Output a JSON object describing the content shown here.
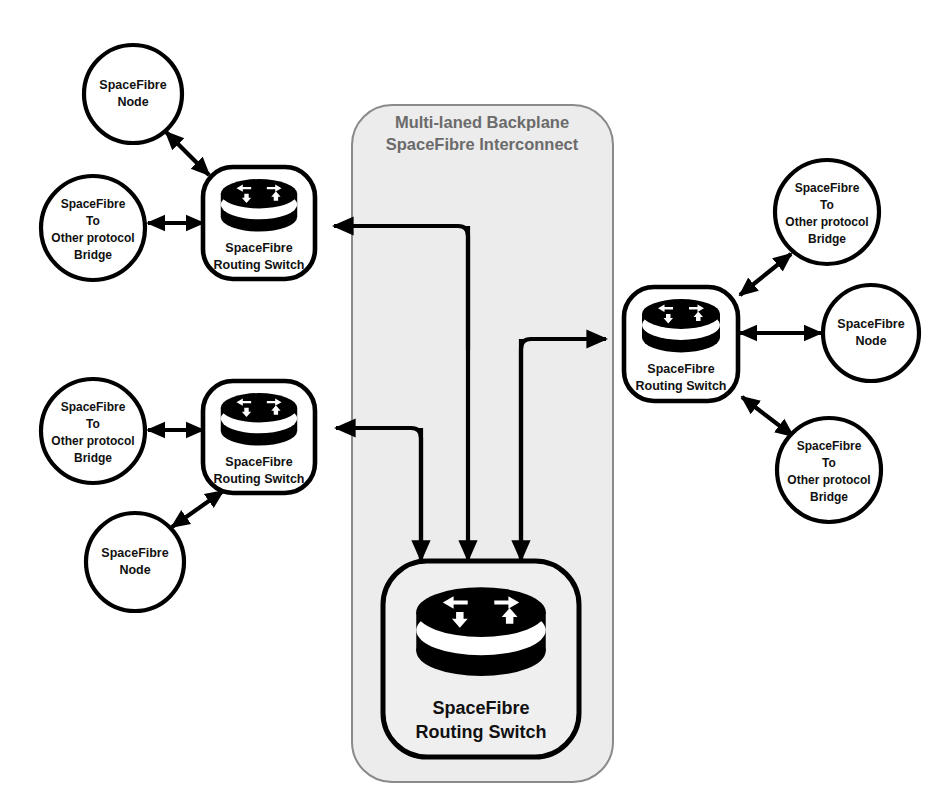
{
  "diagram": {
    "title_line1": "Multi-laned Backplane",
    "title_line2": "SpaceFibre Interconnect",
    "backplane_fill": "#ececec",
    "backplane_stroke": "#8a8a8a",
    "title_color": "#6b6b6b",
    "line_color": "#000000",
    "node_stroke": "#000000",
    "label_color": "#111111"
  },
  "labels": {
    "node_l1": "SpaceFibre",
    "node_l2": "Node",
    "bridge_l1": "SpaceFibre",
    "bridge_l2": "To",
    "bridge_l3": "Other protocol",
    "bridge_l4": "Bridge",
    "switch_l1": "SpaceFibre",
    "switch_l2": "Routing Switch"
  },
  "nodes": [
    {
      "id": "node-top-left",
      "kind": "node",
      "cx": 133,
      "cy": 94,
      "r": 49
    },
    {
      "id": "bridge-top-left",
      "kind": "bridge",
      "cx": 93,
      "cy": 228,
      "r": 52
    },
    {
      "id": "switch-top-left",
      "kind": "switch",
      "cx": 259,
      "cy": 223
    },
    {
      "id": "bridge-mid-left",
      "kind": "bridge",
      "cx": 93,
      "cy": 431,
      "r": 52
    },
    {
      "id": "switch-mid-left",
      "kind": "switch",
      "cx": 259,
      "cy": 437
    },
    {
      "id": "node-mid-left",
      "kind": "node",
      "cx": 135,
      "cy": 562,
      "r": 49
    },
    {
      "id": "switch-right",
      "kind": "switch",
      "cx": 680,
      "cy": 343
    },
    {
      "id": "bridge-right-top",
      "kind": "bridge",
      "cx": 827,
      "cy": 212
    },
    {
      "id": "node-right",
      "kind": "node",
      "cx": 871,
      "cy": 333,
      "r": 48
    },
    {
      "id": "bridge-right-bottom",
      "kind": "bridge",
      "cx": 829,
      "cy": 470
    },
    {
      "id": "switch-backplane",
      "kind": "switch",
      "cx": 481,
      "cy": 645
    }
  ],
  "backplane": {
    "x": 352,
    "y": 105,
    "width": 261,
    "height": 677,
    "radius": 40
  },
  "connections": [
    {
      "id": "conn-node-topleft-to-switch",
      "kind": "bidirectional-diagonal"
    },
    {
      "id": "conn-bridge-topleft-to-switch",
      "kind": "bidirectional-horizontal"
    },
    {
      "id": "conn-bridge-midleft-to-switch",
      "kind": "bidirectional-horizontal"
    },
    {
      "id": "conn-node-midleft-to-switch",
      "kind": "bidirectional-diagonal"
    },
    {
      "id": "conn-bridge-righttop-to-switch",
      "kind": "bidirectional-diagonal"
    },
    {
      "id": "conn-node-right-to-switch",
      "kind": "bidirectional-horizontal"
    },
    {
      "id": "conn-bridge-rightbot-to-switch",
      "kind": "bidirectional-diagonal"
    },
    {
      "id": "conn-backplane-to-switch-topleft",
      "kind": "routed-arrow"
    },
    {
      "id": "conn-backplane-to-switch-midleft",
      "kind": "routed-arrow"
    },
    {
      "id": "conn-backplane-to-switch-right",
      "kind": "routed-arrow"
    },
    {
      "id": "conn-topleft-to-backplane-switch",
      "kind": "routed-arrow"
    },
    {
      "id": "conn-midleft-to-backplane-switch",
      "kind": "routed-arrow"
    },
    {
      "id": "conn-right-to-backplane-switch",
      "kind": "routed-arrow"
    }
  ]
}
